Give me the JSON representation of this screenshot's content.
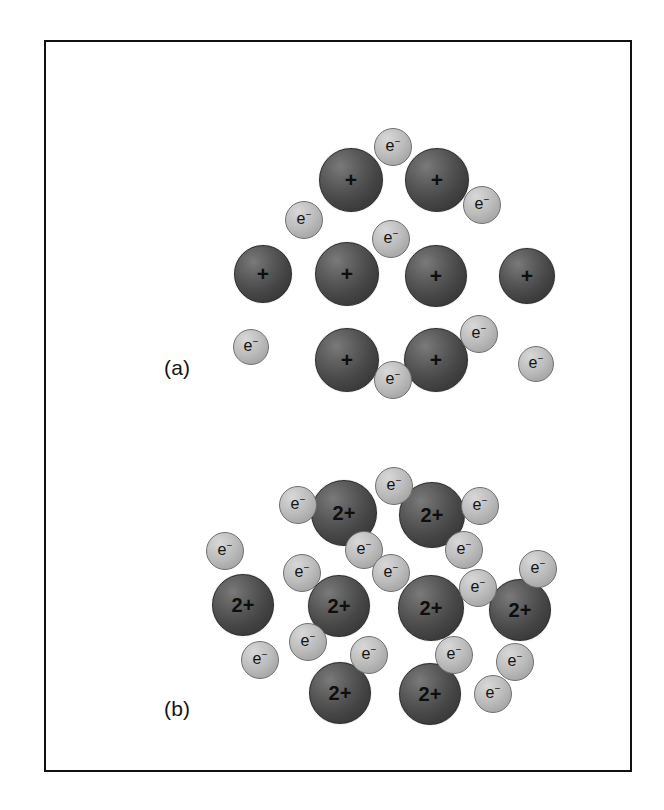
{
  "figure": {
    "background_color": "#ffffff",
    "frame_color": "#111111",
    "cation_color": "#4a4a4a",
    "electron_color": "#bcbcbc",
    "cation_label_color": "#0e0e0e",
    "electron_label_color": "#141414"
  },
  "panels": [
    {
      "id": "panel-a",
      "label": "(a)",
      "label_x": 118,
      "label_y": 314,
      "cation_charge": "+",
      "electron_charge": "e",
      "electron_superscript": "−",
      "cation_count": 8,
      "electron_count": 8,
      "cations": [
        {
          "name": "cation-a1",
          "cx": 305,
          "cy": 138,
          "r": 32,
          "charge": "+",
          "font_size": 21
        },
        {
          "name": "cation-a2",
          "cx": 391,
          "cy": 138,
          "r": 32,
          "charge": "+",
          "font_size": 21
        },
        {
          "name": "cation-a3",
          "cx": 217,
          "cy": 232,
          "r": 29,
          "charge": "+",
          "font_size": 21
        },
        {
          "name": "cation-a4",
          "cx": 301,
          "cy": 232,
          "r": 32,
          "charge": "+",
          "font_size": 21
        },
        {
          "name": "cation-a5",
          "cx": 390,
          "cy": 234,
          "r": 31,
          "charge": "+",
          "font_size": 21
        },
        {
          "name": "cation-a6",
          "cx": 481,
          "cy": 234,
          "r": 28,
          "charge": "+",
          "font_size": 21
        },
        {
          "name": "cation-a7",
          "cx": 301,
          "cy": 318,
          "r": 32,
          "charge": "+",
          "font_size": 21
        },
        {
          "name": "cation-a8",
          "cx": 390,
          "cy": 318,
          "r": 32,
          "charge": "+",
          "font_size": 21
        }
      ],
      "electrons": [
        {
          "name": "electron-a1",
          "cx": 347,
          "cy": 105,
          "r": 19,
          "font_size": 16
        },
        {
          "name": "electron-a2",
          "cx": 258,
          "cy": 178,
          "r": 19,
          "font_size": 16
        },
        {
          "name": "electron-a3",
          "cx": 436,
          "cy": 163,
          "r": 19,
          "font_size": 16
        },
        {
          "name": "electron-a4",
          "cx": 345,
          "cy": 197,
          "r": 19,
          "font_size": 16
        },
        {
          "name": "electron-a5",
          "cx": 205,
          "cy": 305,
          "r": 18,
          "font_size": 16
        },
        {
          "name": "electron-a6",
          "cx": 347,
          "cy": 338,
          "r": 19,
          "font_size": 16
        },
        {
          "name": "electron-a7",
          "cx": 433,
          "cy": 292,
          "r": 19,
          "font_size": 16
        },
        {
          "name": "electron-a8",
          "cx": 490,
          "cy": 322,
          "r": 18,
          "font_size": 16
        }
      ]
    },
    {
      "id": "panel-b",
      "label": "(b)",
      "label_x": 118,
      "label_y": 655,
      "cation_charge": "2+",
      "electron_charge": "e",
      "electron_superscript": "−",
      "cation_count": 8,
      "electron_count": 16,
      "cations": [
        {
          "name": "cation-b1",
          "cx": 298,
          "cy": 471,
          "r": 33,
          "charge": "2+",
          "font_size": 20
        },
        {
          "name": "cation-b2",
          "cx": 386,
          "cy": 473,
          "r": 33,
          "charge": "2+",
          "font_size": 20
        },
        {
          "name": "cation-b3",
          "cx": 197,
          "cy": 563,
          "r": 31,
          "charge": "2+",
          "font_size": 20
        },
        {
          "name": "cation-b4",
          "cx": 293,
          "cy": 564,
          "r": 31,
          "charge": "2+",
          "font_size": 20
        },
        {
          "name": "cation-b5",
          "cx": 385,
          "cy": 566,
          "r": 33,
          "charge": "2+",
          "font_size": 20
        },
        {
          "name": "cation-b6",
          "cx": 474,
          "cy": 568,
          "r": 31,
          "charge": "2+",
          "font_size": 20
        },
        {
          "name": "cation-b7",
          "cx": 294,
          "cy": 651,
          "r": 31,
          "charge": "2+",
          "font_size": 20
        },
        {
          "name": "cation-b8",
          "cx": 384,
          "cy": 652,
          "r": 31,
          "charge": "2+",
          "font_size": 20
        }
      ],
      "electrons": [
        {
          "name": "electron-b1",
          "cx": 252,
          "cy": 463,
          "r": 19,
          "font_size": 16
        },
        {
          "name": "electron-b2",
          "cx": 348,
          "cy": 444,
          "r": 19,
          "font_size": 16
        },
        {
          "name": "electron-b3",
          "cx": 434,
          "cy": 464,
          "r": 19,
          "font_size": 16
        },
        {
          "name": "electron-b4",
          "cx": 179,
          "cy": 509,
          "r": 19,
          "font_size": 16
        },
        {
          "name": "electron-b5",
          "cx": 418,
          "cy": 508,
          "r": 19,
          "font_size": 16
        },
        {
          "name": "electron-b6",
          "cx": 256,
          "cy": 531,
          "r": 19,
          "font_size": 16
        },
        {
          "name": "electron-b7",
          "cx": 318,
          "cy": 508,
          "r": 19,
          "font_size": 16
        },
        {
          "name": "electron-b8",
          "cx": 345,
          "cy": 531,
          "r": 19,
          "font_size": 16
        },
        {
          "name": "electron-b9",
          "cx": 492,
          "cy": 527,
          "r": 19,
          "font_size": 16
        },
        {
          "name": "electron-b10",
          "cx": 432,
          "cy": 546,
          "r": 19,
          "font_size": 16
        },
        {
          "name": "electron-b11",
          "cx": 262,
          "cy": 600,
          "r": 19,
          "font_size": 16
        },
        {
          "name": "electron-b12",
          "cx": 214,
          "cy": 618,
          "r": 19,
          "font_size": 16
        },
        {
          "name": "electron-b13",
          "cx": 323,
          "cy": 613,
          "r": 19,
          "font_size": 16
        },
        {
          "name": "electron-b14",
          "cx": 408,
          "cy": 613,
          "r": 19,
          "font_size": 16
        },
        {
          "name": "electron-b15",
          "cx": 469,
          "cy": 620,
          "r": 19,
          "font_size": 16
        },
        {
          "name": "electron-b16",
          "cx": 447,
          "cy": 652,
          "r": 19,
          "font_size": 16
        }
      ]
    }
  ]
}
